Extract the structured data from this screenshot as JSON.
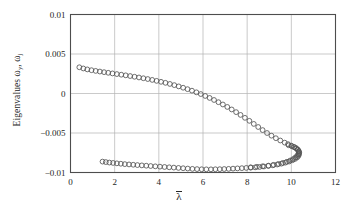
{
  "figure": {
    "background_color": "#ffffff",
    "axes_color": "#4d4d4d",
    "grid_color": "#b3b3b3",
    "marker_color": "#555555",
    "text_color": "#262626"
  },
  "axis": {
    "xlabel_symbol": "λ",
    "ylabel_prefix": "Eigenvalues ",
    "ylabel_omega1": "ω",
    "ylabel_sub1": "y",
    "ylabel_sep": ", ",
    "ylabel_omega2": "ω",
    "ylabel_sub2": "j"
  },
  "chart_data": {
    "type": "scatter",
    "title": "",
    "subtitle": "",
    "xlabel": "λ̄",
    "ylabel": "Eigenvalues ω_y, ω_j",
    "xlim": [
      0,
      12
    ],
    "ylim": [
      -0.01,
      0.01
    ],
    "xticks": [
      0,
      2,
      4,
      6,
      8,
      10,
      12
    ],
    "xtick_labels": [
      "0",
      "2",
      "4",
      "6",
      "8",
      "10",
      "12"
    ],
    "yticks": [
      -0.01,
      -0.005,
      0,
      0.005,
      0.01
    ],
    "ytick_labels": [
      "−0.01",
      "−0.005",
      "0",
      "0.005",
      "0.01"
    ],
    "grid": true,
    "legend": "none",
    "marker": "open-circle",
    "marker_size": 2.4,
    "series": [
      {
        "name": "upper-branch",
        "points": [
          [
            0.4,
            0.00332
          ],
          [
            0.58,
            0.00317
          ],
          [
            0.76,
            0.00305
          ],
          [
            0.95,
            0.00295
          ],
          [
            1.14,
            0.00286
          ],
          [
            1.33,
            0.00278
          ],
          [
            1.52,
            0.0027
          ],
          [
            1.71,
            0.00262
          ],
          [
            1.9,
            0.00254
          ],
          [
            2.1,
            0.00246
          ],
          [
            2.3,
            0.00238
          ],
          [
            2.5,
            0.0023
          ],
          [
            2.7,
            0.00221
          ],
          [
            2.9,
            0.00212
          ],
          [
            3.1,
            0.00203
          ],
          [
            3.3,
            0.00193
          ],
          [
            3.5,
            0.00183
          ],
          [
            3.7,
            0.00172
          ],
          [
            3.9,
            0.0016
          ],
          [
            4.1,
            0.00148
          ],
          [
            4.3,
            0.00135
          ],
          [
            4.5,
            0.00121
          ],
          [
            4.7,
            0.00106
          ],
          [
            4.9,
            0.0009
          ],
          [
            5.1,
            0.00073
          ],
          [
            5.3,
            0.00055
          ],
          [
            5.5,
            0.00036
          ],
          [
            5.7,
            0.00015
          ],
          [
            5.9,
            -7e-05
          ],
          [
            6.1,
            -0.00031
          ],
          [
            6.3,
            -0.00056
          ],
          [
            6.5,
            -0.00082
          ],
          [
            6.7,
            -0.0011
          ],
          [
            6.9,
            -0.00139
          ],
          [
            7.1,
            -0.0017
          ],
          [
            7.3,
            -0.00202
          ],
          [
            7.5,
            -0.00236
          ],
          [
            7.7,
            -0.00271
          ],
          [
            7.9,
            -0.00308
          ],
          [
            8.1,
            -0.00346
          ],
          [
            8.3,
            -0.00385
          ],
          [
            8.5,
            -0.00424
          ],
          [
            8.7,
            -0.00463
          ],
          [
            8.9,
            -0.005
          ],
          [
            9.1,
            -0.00534
          ],
          [
            9.3,
            -0.00566
          ],
          [
            9.5,
            -0.00595
          ],
          [
            9.7,
            -0.00622
          ],
          [
            9.85,
            -0.00641
          ],
          [
            10.0,
            -0.0066
          ],
          [
            10.12,
            -0.00676
          ],
          [
            10.22,
            -0.00692
          ],
          [
            10.29,
            -0.0071
          ],
          [
            10.33,
            -0.0073
          ],
          [
            10.34,
            -0.0075
          ],
          [
            10.31,
            -0.0077
          ],
          [
            10.26,
            -0.0079
          ],
          [
            10.18,
            -0.0081
          ],
          [
            10.08,
            -0.0083
          ],
          [
            9.95,
            -0.00848
          ],
          [
            9.8,
            -0.00864
          ],
          [
            9.62,
            -0.00879
          ],
          [
            9.42,
            -0.00892
          ],
          [
            9.2,
            -0.00903
          ],
          [
            8.96,
            -0.00913
          ],
          [
            8.7,
            -0.00921
          ],
          [
            8.44,
            -0.00928
          ],
          [
            8.16,
            -0.00934
          ]
        ]
      },
      {
        "name": "lower-branch",
        "points": [
          [
            1.45,
            -0.00862
          ],
          [
            1.6,
            -0.00868
          ],
          [
            1.76,
            -0.00874
          ],
          [
            1.93,
            -0.00879
          ],
          [
            2.1,
            -0.00884
          ],
          [
            2.28,
            -0.00889
          ],
          [
            2.46,
            -0.00894
          ],
          [
            2.65,
            -0.00898
          ],
          [
            2.84,
            -0.00902
          ],
          [
            3.03,
            -0.00906
          ],
          [
            3.23,
            -0.0091
          ],
          [
            3.43,
            -0.00914
          ],
          [
            3.63,
            -0.00918
          ],
          [
            3.84,
            -0.00922
          ],
          [
            4.05,
            -0.00926
          ],
          [
            4.26,
            -0.0093
          ],
          [
            4.47,
            -0.00934
          ],
          [
            4.68,
            -0.00938
          ],
          [
            4.89,
            -0.00942
          ],
          [
            5.1,
            -0.00946
          ],
          [
            5.31,
            -0.0095
          ],
          [
            5.52,
            -0.00954
          ],
          [
            5.73,
            -0.00957
          ],
          [
            5.94,
            -0.00959
          ],
          [
            6.15,
            -0.0096
          ],
          [
            6.36,
            -0.0096
          ],
          [
            6.56,
            -0.00959
          ],
          [
            6.76,
            -0.00958
          ],
          [
            6.96,
            -0.00956
          ],
          [
            7.16,
            -0.00954
          ],
          [
            7.36,
            -0.00951
          ],
          [
            7.56,
            -0.00948
          ],
          [
            7.76,
            -0.00945
          ],
          [
            7.96,
            -0.00942
          ],
          [
            8.16,
            -0.00939
          ],
          [
            8.36,
            -0.00935
          ],
          [
            8.56,
            -0.0093
          ],
          [
            8.76,
            -0.00924
          ],
          [
            8.96,
            -0.00917
          ],
          [
            9.16,
            -0.00909
          ],
          [
            9.36,
            -0.00899
          ],
          [
            9.55,
            -0.00888
          ],
          [
            9.73,
            -0.00875
          ],
          [
            9.9,
            -0.00861
          ],
          [
            10.05,
            -0.00845
          ],
          [
            10.17,
            -0.00828
          ],
          [
            10.26,
            -0.0081
          ],
          [
            10.32,
            -0.00791
          ],
          [
            10.35,
            -0.00771
          ],
          [
            10.36,
            -0.00751
          ],
          [
            10.34,
            -0.00731
          ],
          [
            10.29,
            -0.00712
          ],
          [
            10.22,
            -0.00695
          ],
          [
            10.13,
            -0.0068
          ],
          [
            10.02,
            -0.00667
          ],
          [
            9.88,
            -0.00655
          ]
        ]
      }
    ]
  }
}
